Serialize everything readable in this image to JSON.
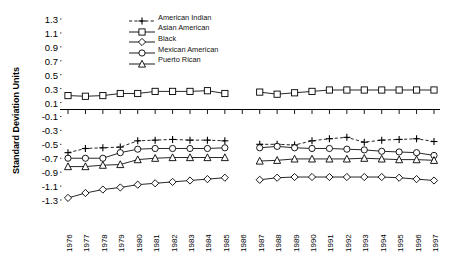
{
  "chart_data": {
    "type": "line",
    "title": "",
    "xlabel": "",
    "ylabel": "Standard Deviation Units",
    "ylim": [
      -1.3,
      1.3
    ],
    "ytick_step": 0.2,
    "grid": false,
    "legend_position": "top-center",
    "axis_break": "no data plotted for 1986",
    "yticks": [
      "1.3",
      "1.1",
      "0.9",
      "0.7",
      "0.5",
      "0.3",
      "0.1",
      "-0.1",
      "-0.3",
      "-0.5",
      "-0.7",
      "-0.9",
      "-1.1",
      "-1.3"
    ],
    "categories": [
      1976,
      1977,
      1978,
      1979,
      1980,
      1981,
      1982,
      1983,
      1984,
      1985,
      1986,
      1987,
      1988,
      1989,
      1990,
      1991,
      1992,
      1993,
      1994,
      1995,
      1996,
      1997
    ],
    "xtick_labels": [
      "1976",
      "1977",
      "1978",
      "1979",
      "1980",
      "1981",
      "1982",
      "1983",
      "1984",
      "1985",
      "1986",
      "1987",
      "1988",
      "1989",
      "1990",
      "1991",
      "1992",
      "1993",
      "1994",
      "1995",
      "1996",
      "1997"
    ],
    "series": [
      {
        "name": "American Indian",
        "marker": "plus",
        "dash": true,
        "values": [
          -0.62,
          -0.56,
          -0.55,
          -0.54,
          -0.45,
          -0.44,
          -0.43,
          -0.44,
          -0.44,
          -0.45,
          null,
          -0.5,
          -0.5,
          -0.51,
          -0.45,
          -0.42,
          -0.4,
          -0.47,
          -0.44,
          -0.43,
          -0.42,
          -0.46
        ]
      },
      {
        "name": "Asian American",
        "marker": "square",
        "dash": false,
        "values": [
          0.2,
          0.19,
          0.2,
          0.23,
          0.23,
          0.26,
          0.26,
          0.26,
          0.27,
          0.23,
          null,
          0.25,
          0.22,
          0.24,
          0.26,
          0.28,
          0.28,
          0.28,
          0.28,
          0.28,
          0.28,
          0.28
        ]
      },
      {
        "name": "Black",
        "marker": "diamond",
        "dash": false,
        "values": [
          -1.27,
          -1.2,
          -1.15,
          -1.12,
          -1.08,
          -1.06,
          -1.04,
          -1.02,
          -1.0,
          -0.98,
          null,
          -1.01,
          -0.98,
          -0.97,
          -0.97,
          -0.97,
          -0.97,
          -0.97,
          -0.97,
          -0.98,
          -1.0,
          -1.02
        ]
      },
      {
        "name": "Mexican American",
        "marker": "circle",
        "dash": false,
        "values": [
          -0.7,
          -0.7,
          -0.7,
          -0.62,
          -0.57,
          -0.56,
          -0.56,
          -0.56,
          -0.56,
          -0.55,
          null,
          -0.55,
          -0.53,
          -0.55,
          -0.56,
          -0.56,
          -0.57,
          -0.58,
          -0.6,
          -0.61,
          -0.62,
          -0.66
        ]
      },
      {
        "name": "Puerto Rican",
        "marker": "triangle",
        "dash": false,
        "values": [
          -0.82,
          -0.82,
          -0.8,
          -0.79,
          -0.72,
          -0.7,
          -0.69,
          -0.69,
          -0.69,
          -0.69,
          null,
          -0.74,
          -0.73,
          -0.71,
          -0.71,
          -0.71,
          -0.71,
          -0.7,
          -0.71,
          -0.72,
          -0.72,
          -0.73
        ]
      }
    ]
  },
  "legend": {
    "items": [
      {
        "label": "American Indian"
      },
      {
        "label": "Asian American"
      },
      {
        "label": "Black"
      },
      {
        "label": "Mexican American"
      },
      {
        "label": "Puerto Rican"
      }
    ]
  }
}
